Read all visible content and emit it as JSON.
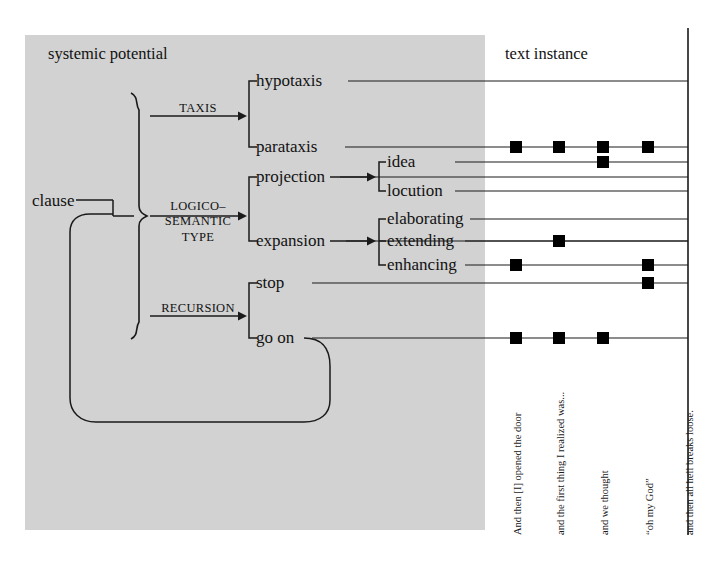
{
  "figure": {
    "panel_label": "systemic potential",
    "instance_label": "text instance",
    "panel_bg": "#d2d2d2",
    "line_color": "#1a1a1a",
    "marker_color": "#000000"
  },
  "root": {
    "label": "clause"
  },
  "systems": [
    {
      "name": "TAXIS",
      "lines": [
        "TAXIS"
      ]
    },
    {
      "name": "LOGICO-SEMANTIC TYPE",
      "lines": [
        "LOGICO–",
        "SEMANTIC",
        "TYPE"
      ]
    },
    {
      "name": "RECURSION",
      "lines": [
        "RECURSION"
      ]
    }
  ],
  "features": [
    {
      "key": "hypotaxis",
      "label": "hypotaxis",
      "y": 81,
      "x": 256,
      "level": 1
    },
    {
      "key": "parataxis",
      "label": "parataxis",
      "y": 147,
      "x": 256,
      "level": 1
    },
    {
      "key": "projection",
      "label": "projection",
      "y": 177,
      "x": 256,
      "level": 1
    },
    {
      "key": "idea",
      "label": "idea",
      "y": 162,
      "x": 387,
      "level": 2
    },
    {
      "key": "locution",
      "label": "locution",
      "y": 191,
      "x": 387,
      "level": 2
    },
    {
      "key": "expansion",
      "label": "expansion",
      "y": 241,
      "x": 256,
      "level": 1
    },
    {
      "key": "elaborating",
      "label": "elaborating",
      "y": 219,
      "x": 387,
      "level": 2
    },
    {
      "key": "extending",
      "label": "extending",
      "y": 241,
      "x": 387,
      "level": 2
    },
    {
      "key": "enhancing",
      "label": "enhancing",
      "y": 265,
      "x": 387,
      "level": 2
    },
    {
      "key": "stop",
      "label": "stop",
      "y": 283,
      "x": 256,
      "level": 1
    },
    {
      "key": "go on",
      "label": "go on",
      "y": 338,
      "x": 256,
      "level": 1
    }
  ],
  "columns": [
    {
      "id": 1,
      "x": 516,
      "caption": "And then [I] opened the door"
    },
    {
      "id": 2,
      "x": 559,
      "caption": "and the first thing I realized was..."
    },
    {
      "id": 3,
      "x": 603,
      "caption": "and we thought"
    },
    {
      "id": 4,
      "x": 648,
      "caption": "“oh my God”"
    },
    {
      "id": 5,
      "x": 688,
      "caption": "and then all hell breaks loose."
    }
  ],
  "selections": [
    {
      "feature": "hypotaxis",
      "columns": []
    },
    {
      "feature": "parataxis",
      "columns": [
        1,
        2,
        3,
        4
      ]
    },
    {
      "feature": "projection",
      "columns": []
    },
    {
      "feature": "idea",
      "columns": [
        3
      ]
    },
    {
      "feature": "locution",
      "columns": []
    },
    {
      "feature": "elaborating",
      "columns": []
    },
    {
      "feature": "extending",
      "columns": [
        2
      ]
    },
    {
      "feature": "enhancing",
      "columns": [
        1,
        4
      ]
    },
    {
      "feature": "stop",
      "columns": [
        4
      ]
    },
    {
      "feature": "go on",
      "columns": [
        1,
        2,
        3
      ]
    }
  ]
}
